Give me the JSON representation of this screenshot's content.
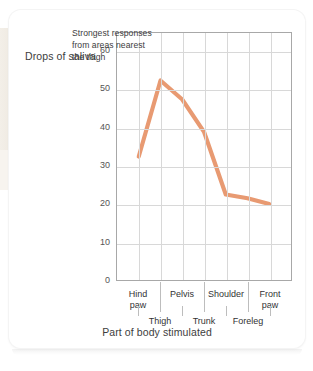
{
  "chart_data": {
    "type": "line",
    "title": "",
    "xlabel": "Part of body stimulated",
    "ylabel": "Drops of saliva",
    "categories": [
      "Hind paw",
      "Thigh",
      "Pelvis",
      "Trunk",
      "Shoulder",
      "Foreleg",
      "Front paw"
    ],
    "values": [
      32.5,
      52.5,
      47.5,
      39,
      22.5,
      21.5,
      20
    ],
    "ylim": [
      0,
      65
    ],
    "y_ticks": [
      "0",
      "10",
      "20",
      "30",
      "40",
      "50",
      "60"
    ],
    "y_tick_values": [
      0,
      10,
      20,
      30,
      40,
      50,
      60
    ],
    "grid": true,
    "legend": "none",
    "series_color": "#e89a72",
    "annotations": [
      {
        "text": "Strongest responses\nfrom areas nearest\nthe thigh"
      }
    ],
    "x_labels_top": [
      "Hind\npaw",
      "Pelvis",
      "Shoulder",
      "Front\npaw"
    ],
    "x_labels_bottom": [
      "Thigh",
      "Trunk",
      "Foreleg"
    ]
  },
  "axes": {
    "y_title": "Drops of saliva",
    "x_title": "Part of body stimulated",
    "y_ticks": [
      {
        "label": "60"
      },
      {
        "label": "50"
      },
      {
        "label": "40"
      },
      {
        "label": "30"
      },
      {
        "label": "20"
      },
      {
        "label": "10"
      },
      {
        "label": "0"
      }
    ],
    "x_top": [
      {
        "label": "Hind\npaw"
      },
      {
        "label": "Pelvis"
      },
      {
        "label": "Shoulder"
      },
      {
        "label": "Front\npaw"
      }
    ],
    "x_bottom": [
      {
        "label": "Thigh"
      },
      {
        "label": "Trunk"
      },
      {
        "label": "Foreleg"
      }
    ]
  },
  "annotation": {
    "text": "Strongest responses\nfrom areas nearest\nthe thigh"
  },
  "colors": {
    "series": "#e89a72",
    "grid": "#d8d8d8",
    "axis": "#a8a8a8",
    "text": "#3d3d3d"
  }
}
